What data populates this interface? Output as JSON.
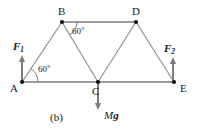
{
  "figure": {
    "caption": "(b)",
    "type": "free-body-truss-diagram"
  },
  "nodes": [
    {
      "id": "A",
      "label": "A",
      "x": 22,
      "y": 82,
      "label_x": 10,
      "label_y": 83
    },
    {
      "id": "B",
      "label": "B",
      "x": 62,
      "y": 22,
      "label_x": 58,
      "label_y": 6
    },
    {
      "id": "C",
      "label": "C",
      "x": 98,
      "y": 82,
      "label_x": 92,
      "label_y": 86
    },
    {
      "id": "D",
      "label": "D",
      "x": 136,
      "y": 22,
      "label_x": 132,
      "label_y": 6
    },
    {
      "id": "E",
      "label": "E",
      "x": 174,
      "y": 82,
      "label_x": 180,
      "label_y": 83
    }
  ],
  "members": [
    {
      "from": "A",
      "to": "B"
    },
    {
      "from": "B",
      "to": "C"
    },
    {
      "from": "B",
      "to": "D"
    },
    {
      "from": "C",
      "to": "D"
    },
    {
      "from": "C",
      "to": "E"
    },
    {
      "from": "D",
      "to": "E"
    },
    {
      "from": "A",
      "to": "C"
    }
  ],
  "forces": [
    {
      "id": "F1",
      "name": "F",
      "subscript": "1",
      "at_node": "A",
      "direction": "up",
      "x": 22,
      "tail_y": 82,
      "head_y": 55,
      "label_x": 13,
      "label_y": 41
    },
    {
      "id": "F2",
      "name": "F",
      "subscript": "2",
      "at_node": "E",
      "direction": "up",
      "x": 173,
      "tail_y": 82,
      "head_y": 57,
      "label_x": 164,
      "label_y": 43
    },
    {
      "id": "Mg",
      "name": "M",
      "subscript": "g",
      "at_node": "C",
      "direction": "down",
      "x": 98,
      "tail_y": 82,
      "head_y": 110,
      "label_x": 104,
      "label_y": 110
    }
  ],
  "angles": [
    {
      "id": "angle-at-B",
      "value": "60",
      "unit": "°",
      "vertex": "B",
      "between": [
        "BD",
        "BC"
      ],
      "label_x": 72,
      "label_y": 26,
      "arc": {
        "cx": 62,
        "cy": 22,
        "r": 15,
        "start_deg": 0,
        "end_deg": 60
      }
    },
    {
      "id": "angle-at-A",
      "value": "60",
      "unit": "°",
      "vertex": "A",
      "between": [
        "AC",
        "AB"
      ],
      "label_x": 38,
      "label_y": 64,
      "arc": {
        "cx": 22,
        "cy": 82,
        "r": 16,
        "start_deg": 0,
        "end_deg": 56
      }
    }
  ],
  "style": {
    "member_color": "#8a8a8a",
    "member_color_dark": "#6e6e6e",
    "chord_color": "#9a9a9a",
    "arrow_color": "#7d7d7d",
    "node_color": "#111111",
    "text_color": "#1a1a1a",
    "background": "#ffffff"
  }
}
